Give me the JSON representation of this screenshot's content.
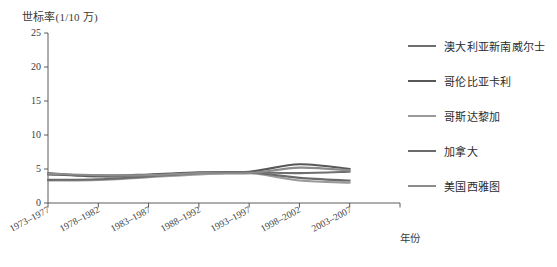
{
  "chart_data": {
    "type": "line",
    "title": "",
    "ylabel": "世标率(1/10 万)",
    "xlabel": "年份",
    "ylim": [
      0,
      25
    ],
    "yticks": [
      0,
      5,
      10,
      15,
      20,
      25
    ],
    "grid": false,
    "legend_position": "right",
    "categories": [
      "1973-1977",
      "1978-1982",
      "1983-1987",
      "1988-1992",
      "1993-1997",
      "1998-2002",
      "2003-2007"
    ],
    "series": [
      {
        "name": "澳大利亚新南威尔士",
        "color": "#6f6f6f",
        "values": [
          4.4,
          3.9,
          4.0,
          4.3,
          4.5,
          4.4,
          4.6
        ]
      },
      {
        "name": "哥伦比亚卡利",
        "color": "#585858",
        "values": [
          4.2,
          4.0,
          4.2,
          4.5,
          4.6,
          5.7,
          5.0
        ]
      },
      {
        "name": "哥斯达黎加",
        "color": "#9a9a9a",
        "values": [
          3.3,
          3.4,
          3.8,
          4.2,
          4.4,
          3.3,
          3.0
        ]
      },
      {
        "name": "加拿大",
        "color": "#6b6b6b",
        "values": [
          3.4,
          3.5,
          3.9,
          4.4,
          4.5,
          3.7,
          3.3
        ]
      },
      {
        "name": "美国西雅图",
        "color": "#8c8c8c",
        "values": [
          4.3,
          4.1,
          4.1,
          4.4,
          4.4,
          5.2,
          4.8
        ]
      }
    ]
  },
  "axis": {
    "y_tick_labels": [
      "25",
      "20",
      "15",
      "10",
      "5",
      "0"
    ],
    "x_tick_labels": [
      "1973–1977",
      "1978–1982",
      "1983–1987",
      "1988–1992",
      "1993–1997",
      "1998–2002",
      "2003–2007"
    ]
  },
  "legend": {
    "items": [
      {
        "label": "澳大利亚新南威尔士",
        "color": "#6f6f6f"
      },
      {
        "label": "哥伦比亚卡利",
        "color": "#585858"
      },
      {
        "label": "哥斯达黎加",
        "color": "#9a9a9a"
      },
      {
        "label": "加拿大",
        "color": "#6b6b6b"
      },
      {
        "label": "美国西雅图",
        "color": "#8c8c8c"
      }
    ]
  }
}
